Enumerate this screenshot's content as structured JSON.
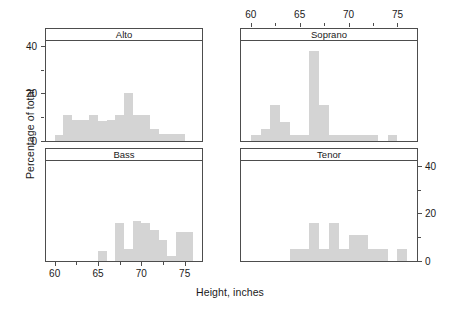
{
  "chart_data": {
    "type": "bar",
    "subtype": "histogram-trellis",
    "title": "",
    "xlabel": "Height, inches",
    "ylabel": "Percentage of total",
    "xlim": [
      59.0,
      77.0
    ],
    "ylim": [
      0,
      42
    ],
    "bin_width": 1.0,
    "grid": false,
    "legend": null,
    "axes": {
      "x_ticks": [
        60,
        65,
        70,
        75
      ],
      "x_ticklabels": [
        "60",
        "65",
        "70",
        "75"
      ],
      "x_minor_ticks": [
        62.5,
        67.5,
        72.5
      ],
      "y_ticks": [
        0,
        20,
        40
      ],
      "y_ticklabels": [
        "0",
        "20",
        "40"
      ],
      "y_minor_ticks": [
        10,
        30
      ],
      "x_axis_top_panels": [
        "Soprano"
      ],
      "x_axis_bottom_panels": [
        "Bass"
      ],
      "y_axis_left_panels": [
        "Alto"
      ],
      "y_axis_right_panels": [
        "Tenor"
      ]
    },
    "bar_color": "#d4d4d4",
    "frame_color": "#4d4d4d",
    "panels": [
      {
        "name": "Alto",
        "position": "top-left",
        "bins": [
          {
            "x": 59.5,
            "value": 0
          },
          {
            "x": 60.5,
            "value": 2.5
          },
          {
            "x": 61.5,
            "value": 11
          },
          {
            "x": 62.5,
            "value": 9
          },
          {
            "x": 63.5,
            "value": 9
          },
          {
            "x": 64.5,
            "value": 11
          },
          {
            "x": 65.5,
            "value": 8.5
          },
          {
            "x": 66.5,
            "value": 9
          },
          {
            "x": 67.5,
            "value": 11
          },
          {
            "x": 68.5,
            "value": 20
          },
          {
            "x": 69.5,
            "value": 11
          },
          {
            "x": 70.5,
            "value": 11
          },
          {
            "x": 71.5,
            "value": 5
          },
          {
            "x": 72.5,
            "value": 3
          },
          {
            "x": 73.5,
            "value": 3
          },
          {
            "x": 74.5,
            "value": 3
          },
          {
            "x": 75.5,
            "value": 0
          }
        ]
      },
      {
        "name": "Soprano",
        "position": "top-right",
        "bins": [
          {
            "x": 59.5,
            "value": 0
          },
          {
            "x": 60.5,
            "value": 2.5
          },
          {
            "x": 61.5,
            "value": 5
          },
          {
            "x": 62.5,
            "value": 15
          },
          {
            "x": 63.5,
            "value": 8
          },
          {
            "x": 64.5,
            "value": 2.5
          },
          {
            "x": 65.5,
            "value": 2.5
          },
          {
            "x": 66.5,
            "value": 38
          },
          {
            "x": 67.5,
            "value": 15
          },
          {
            "x": 68.5,
            "value": 2.5
          },
          {
            "x": 69.5,
            "value": 2.5
          },
          {
            "x": 70.5,
            "value": 2.5
          },
          {
            "x": 71.5,
            "value": 2.5
          },
          {
            "x": 72.5,
            "value": 2.5
          },
          {
            "x": 73.5,
            "value": 0
          },
          {
            "x": 74.5,
            "value": 2.5
          },
          {
            "x": 75.5,
            "value": 0
          }
        ]
      },
      {
        "name": "Bass",
        "position": "bottom-left",
        "bins": [
          {
            "x": 59.5,
            "value": 0
          },
          {
            "x": 60.5,
            "value": 0
          },
          {
            "x": 61.5,
            "value": 0
          },
          {
            "x": 62.5,
            "value": 0
          },
          {
            "x": 63.5,
            "value": 0
          },
          {
            "x": 64.5,
            "value": 0
          },
          {
            "x": 65.5,
            "value": 4
          },
          {
            "x": 66.5,
            "value": 0
          },
          {
            "x": 67.5,
            "value": 16
          },
          {
            "x": 68.5,
            "value": 5
          },
          {
            "x": 69.5,
            "value": 17
          },
          {
            "x": 70.5,
            "value": 16
          },
          {
            "x": 71.5,
            "value": 13
          },
          {
            "x": 72.5,
            "value": 9
          },
          {
            "x": 73.5,
            "value": 2
          },
          {
            "x": 74.5,
            "value": 12
          },
          {
            "x": 75.5,
            "value": 12
          }
        ]
      },
      {
        "name": "Tenor",
        "position": "bottom-right",
        "bins": [
          {
            "x": 59.5,
            "value": 0
          },
          {
            "x": 60.5,
            "value": 0
          },
          {
            "x": 61.5,
            "value": 0
          },
          {
            "x": 62.5,
            "value": 0
          },
          {
            "x": 63.5,
            "value": 0
          },
          {
            "x": 64.5,
            "value": 5
          },
          {
            "x": 65.5,
            "value": 5
          },
          {
            "x": 66.5,
            "value": 16
          },
          {
            "x": 67.5,
            "value": 5
          },
          {
            "x": 68.5,
            "value": 16
          },
          {
            "x": 69.5,
            "value": 5
          },
          {
            "x": 70.5,
            "value": 11
          },
          {
            "x": 71.5,
            "value": 11
          },
          {
            "x": 72.5,
            "value": 5
          },
          {
            "x": 73.5,
            "value": 5
          },
          {
            "x": 74.5,
            "value": 0
          },
          {
            "x": 75.5,
            "value": 5
          }
        ]
      }
    ]
  }
}
